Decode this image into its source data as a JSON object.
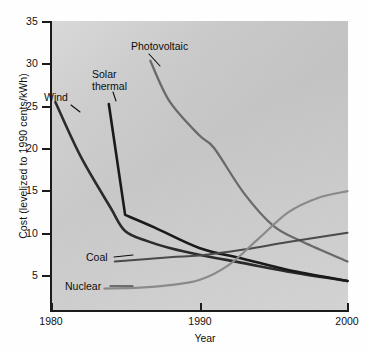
{
  "chart_data": {
    "type": "line",
    "title": "",
    "xlabel": "Year",
    "ylabel": "Cost (levelized to 1990 cents/kWh)",
    "xlim": [
      1980,
      2000
    ],
    "ylim": [
      0,
      35
    ],
    "xticks": [
      "1980",
      "1990",
      "2000"
    ],
    "yticks": [
      "5",
      "10",
      "15",
      "20",
      "25",
      "30",
      "35"
    ],
    "grid": false,
    "legend": "inline-annotations",
    "series": [
      {
        "name": "Wind",
        "color": "#2b2b2b",
        "x": [
          1980.3,
          1982,
          1984,
          1985,
          1986.5,
          1988,
          1990,
          1993,
          1996,
          2000
        ],
        "y": [
          25.4,
          19.0,
          13.0,
          10.2,
          9.0,
          8.2,
          7.4,
          6.4,
          5.4,
          4.3
        ]
      },
      {
        "name": "Solar thermal",
        "color": "#1a1a1a",
        "x": [
          1983.9,
          1985,
          1987,
          1990,
          1993,
          1996,
          2000
        ],
        "y": [
          25.2,
          12.1,
          10.6,
          8.2,
          6.9,
          5.6,
          4.3
        ]
      },
      {
        "name": "Photovoltaic",
        "color": "#6a6a6a",
        "x": [
          1986.7,
          1988,
          1990,
          1991,
          1993,
          1995,
          1997,
          2000
        ],
        "y": [
          30.3,
          25.5,
          21.5,
          20.0,
          14.7,
          10.8,
          8.9,
          6.6
        ]
      },
      {
        "name": "Coal",
        "color": "#4a4a4a",
        "x": [
          1984.3,
          1988,
          1990,
          1993,
          1996,
          2000
        ],
        "y": [
          6.6,
          7.1,
          7.3,
          8.0,
          8.9,
          10.0
        ]
      },
      {
        "name": "Nuclear",
        "color": "#8a8a8a",
        "x": [
          1983.6,
          1986,
          1988,
          1990,
          1992,
          1994,
          1996,
          1998,
          2000
        ],
        "y": [
          3.4,
          3.5,
          3.8,
          4.4,
          6.2,
          9.3,
          12.4,
          14.1,
          14.9
        ]
      }
    ],
    "annotations": [
      {
        "label": "Wind",
        "leader": true
      },
      {
        "label": "Solar\nthermal",
        "leader": true
      },
      {
        "label": "Photovoltaic",
        "leader": true
      },
      {
        "label": "Coal",
        "leader": true
      },
      {
        "label": "Nuclear",
        "leader": true
      }
    ]
  },
  "axis": {
    "y_title": "Cost (levelized to 1990 cents/kWh)",
    "x_title": "Year",
    "y_ticks": [
      "35",
      "30",
      "25",
      "20",
      "15",
      "10",
      "5"
    ],
    "x_ticks": [
      "1980",
      "1990",
      "2000"
    ]
  },
  "labels": {
    "wind": "Wind",
    "solar_line1": "Solar",
    "solar_line2": "thermal",
    "photovoltaic": "Photovoltaic",
    "coal": "Coal",
    "nuclear": "Nuclear"
  },
  "colors": {
    "wind": "#2b2b2b",
    "solar_thermal": "#1a1a1a",
    "photovoltaic": "#6a6a6a",
    "coal": "#4a4a4a",
    "nuclear": "#8a8a8a",
    "panel_background": "#cccccc",
    "axis": "#1b1b1b"
  }
}
